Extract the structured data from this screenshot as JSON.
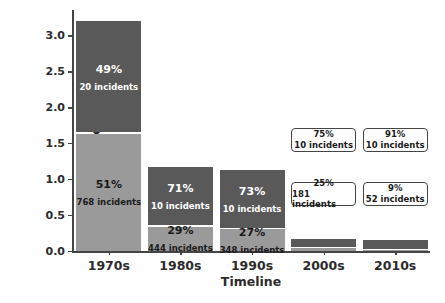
{
  "chart_data": {
    "type": "bar",
    "title": "",
    "xlabel": "Timeline",
    "ylabel": "Oil spill (in million tonnes)",
    "categories": [
      "1970s",
      "1980s",
      "1990s",
      "2000s",
      "2010s"
    ],
    "ylim": [
      0.0,
      3.35
    ],
    "yticks": [
      "0.0",
      "0.5",
      "1.0",
      "1.5",
      "2.0",
      "2.5",
      "3.0"
    ],
    "ytick_values": [
      0.0,
      0.5,
      1.0,
      1.5,
      2.0,
      2.5,
      3.0
    ],
    "grid": false,
    "legend": "none",
    "stacked": true,
    "series": [
      {
        "name": "Large spills (>700 tonnes)",
        "color": "#595959",
        "values": [
          1.57,
          0.83,
          0.82,
          0.12,
          0.14
        ]
      },
      {
        "name": "Medium spills (7-700 tonnes)",
        "color": "#9a9a9a",
        "values": [
          1.63,
          0.34,
          0.3,
          0.04,
          0.01
        ]
      }
    ],
    "bars": [
      {
        "category": "1970s",
        "total": 3.2,
        "top_segment": {
          "percent": "49%",
          "incidents": "20 incidents",
          "value": 1.57,
          "color": "#595959",
          "text_color": "#ffffff"
        },
        "bottom_segment": {
          "percent": "51%",
          "incidents": "768 incidents",
          "value": 1.63,
          "color": "#9a9a9a",
          "text_color": "#1a1a1a"
        },
        "annotated_outside": false
      },
      {
        "category": "1980s",
        "total": 1.17,
        "top_segment": {
          "percent": "71%",
          "incidents": "10 incidents",
          "value": 0.83,
          "color": "#595959",
          "text_color": "#ffffff"
        },
        "bottom_segment": {
          "percent": "29%",
          "incidents": "444 incidents",
          "value": 0.34,
          "color": "#9a9a9a",
          "text_color": "#1a1a1a"
        },
        "annotated_outside": false
      },
      {
        "category": "1990s",
        "total": 1.12,
        "top_segment": {
          "percent": "73%",
          "incidents": "10 incidents",
          "value": 0.82,
          "color": "#595959",
          "text_color": "#ffffff"
        },
        "bottom_segment": {
          "percent": "27%",
          "incidents": "348 incidents",
          "value": 0.3,
          "color": "#9a9a9a",
          "text_color": "#1a1a1a"
        },
        "annotated_outside": false
      },
      {
        "category": "2000s",
        "total": 0.16,
        "top_segment": {
          "percent": "75%",
          "incidents": "10 incidents",
          "value": 0.12,
          "color": "#595959",
          "text_color": "#1a1a1a"
        },
        "bottom_segment": {
          "percent": "25%",
          "incidents": "181 incidents",
          "value": 0.04,
          "color": "#9a9a9a",
          "text_color": "#1a1a1a"
        },
        "annotated_outside": true
      },
      {
        "category": "2010s",
        "total": 0.15,
        "top_segment": {
          "percent": "91%",
          "incidents": "10 incidents",
          "value": 0.14,
          "color": "#595959",
          "text_color": "#1a1a1a"
        },
        "bottom_segment": {
          "percent": "9%",
          "incidents": "52 incidents",
          "value": 0.01,
          "color": "#9a9a9a",
          "text_color": "#1a1a1a"
        },
        "annotated_outside": true
      }
    ]
  },
  "caption": {
    "text": ""
  }
}
